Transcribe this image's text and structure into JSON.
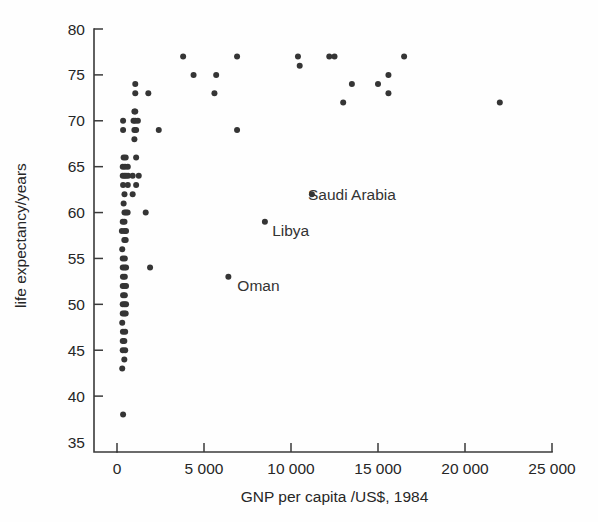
{
  "chart_data": {
    "type": "scatter",
    "title": "",
    "xlabel": "GNP per capita /US$, 1984",
    "ylabel": "life expectancy/years",
    "xlim": [
      0,
      25000
    ],
    "ylim": [
      35,
      80
    ],
    "grid": false,
    "legend": "none",
    "xticks": [
      0,
      5000,
      10000,
      15000,
      20000,
      25000
    ],
    "xtick_labels": [
      "0",
      "5 000",
      "10 000",
      "15 000",
      "20 000",
      "25 000"
    ],
    "yticks": [
      35,
      40,
      45,
      50,
      55,
      60,
      65,
      70,
      75,
      80
    ],
    "ytick_labels": [
      "35",
      "40",
      "45",
      "50",
      "55",
      "60",
      "65",
      "70",
      "75",
      "80"
    ],
    "marker_color": "#353535",
    "marker_size": 6,
    "points": [
      [
        350,
        38
      ],
      [
        300,
        43
      ],
      [
        420,
        44
      ],
      [
        330,
        45
      ],
      [
        470,
        45
      ],
      [
        330,
        46
      ],
      [
        420,
        46
      ],
      [
        340,
        47
      ],
      [
        470,
        47
      ],
      [
        300,
        48
      ],
      [
        330,
        49
      ],
      [
        420,
        49
      ],
      [
        500,
        49
      ],
      [
        330,
        50
      ],
      [
        430,
        50
      ],
      [
        520,
        50
      ],
      [
        350,
        51
      ],
      [
        450,
        51
      ],
      [
        330,
        52
      ],
      [
        430,
        52
      ],
      [
        520,
        52
      ],
      [
        340,
        53
      ],
      [
        450,
        53
      ],
      [
        6400,
        53
      ],
      [
        330,
        54
      ],
      [
        430,
        54
      ],
      [
        520,
        54
      ],
      [
        1900,
        54
      ],
      [
        330,
        55
      ],
      [
        450,
        55
      ],
      [
        300,
        56
      ],
      [
        420,
        57
      ],
      [
        500,
        57
      ],
      [
        280,
        58
      ],
      [
        430,
        58
      ],
      [
        520,
        58
      ],
      [
        8500,
        59
      ],
      [
        330,
        59
      ],
      [
        430,
        59
      ],
      [
        430,
        60
      ],
      [
        520,
        60
      ],
      [
        610,
        60
      ],
      [
        1650,
        60
      ],
      [
        380,
        61
      ],
      [
        430,
        62
      ],
      [
        11200,
        62
      ],
      [
        900,
        62
      ],
      [
        350,
        63
      ],
      [
        620,
        63
      ],
      [
        1100,
        63
      ],
      [
        330,
        64
      ],
      [
        430,
        64
      ],
      [
        520,
        64
      ],
      [
        640,
        64
      ],
      [
        900,
        64
      ],
      [
        1250,
        64
      ],
      [
        330,
        65
      ],
      [
        460,
        65
      ],
      [
        620,
        65
      ],
      [
        380,
        66
      ],
      [
        500,
        66
      ],
      [
        1100,
        66
      ],
      [
        1000,
        68
      ],
      [
        350,
        69
      ],
      [
        1000,
        69
      ],
      [
        1100,
        69
      ],
      [
        2400,
        69
      ],
      [
        6900,
        69
      ],
      [
        350,
        70
      ],
      [
        950,
        70
      ],
      [
        1050,
        70
      ],
      [
        1200,
        70
      ],
      [
        1000,
        71
      ],
      [
        1050,
        71
      ],
      [
        13000,
        72
      ],
      [
        22000,
        72
      ],
      [
        1800,
        73
      ],
      [
        1050,
        73
      ],
      [
        5600,
        73
      ],
      [
        15600,
        73
      ],
      [
        1050,
        74
      ],
      [
        13500,
        74
      ],
      [
        15000,
        74
      ],
      [
        4400,
        75
      ],
      [
        5700,
        75
      ],
      [
        15600,
        75
      ],
      [
        10500,
        76
      ],
      [
        3800,
        77
      ],
      [
        10400,
        77
      ],
      [
        12200,
        77
      ],
      [
        12500,
        77
      ],
      [
        16500,
        77
      ],
      [
        6900,
        77
      ]
    ],
    "annotations": [
      {
        "label": "Saudi Arabia",
        "x": 10400,
        "y": 62,
        "dx": 10,
        "dy": 6
      },
      {
        "label": "Libya",
        "x": 8400,
        "y": 59,
        "dx": 9,
        "dy": 14
      },
      {
        "label": "Oman",
        "x": 6400,
        "y": 53,
        "dx": 9,
        "dy": 14
      }
    ]
  }
}
